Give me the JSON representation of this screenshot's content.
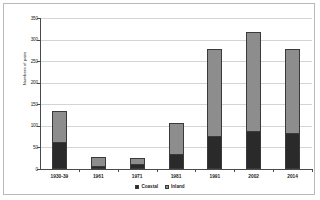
{
  "chart_data": {
    "type": "bar",
    "subtype": "stacked-vertical",
    "title": "",
    "xlabel": "",
    "ylabel": "Numbers of pairs",
    "ylim": [
      0,
      350
    ],
    "yticks": [
      0,
      50,
      100,
      150,
      200,
      250,
      300,
      350
    ],
    "ytick_labels": [
      "0",
      "50",
      "100",
      "150",
      "200",
      "250",
      "300",
      "350"
    ],
    "grid": true,
    "legend_position": "bottom",
    "categories": [
      "1930-39",
      "1961",
      "1971",
      "1981",
      "1991",
      "2002",
      "2014"
    ],
    "series": [
      {
        "name": "Coastal",
        "color": "#2a2a2a",
        "values": [
          62,
          6,
          11,
          35,
          76,
          87,
          82
        ]
      },
      {
        "name": "Inland",
        "color": "#8d8d8d",
        "values": [
          73,
          21,
          15,
          71,
          203,
          231,
          196
        ]
      }
    ],
    "totals": [
      135,
      27,
      26,
      106,
      279,
      318,
      278
    ]
  },
  "legend": {
    "entries": [
      {
        "label": "Coastal"
      },
      {
        "label": "Inland"
      }
    ]
  },
  "colors": {
    "coastal": "#2a2a2a",
    "inland": "#8d8d8d",
    "gridline": "#d4d4d4",
    "axis": "#4a4a4a",
    "frame": "#b9b9b9",
    "background": "#ffffff"
  }
}
